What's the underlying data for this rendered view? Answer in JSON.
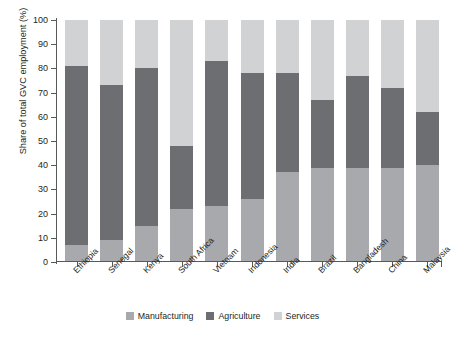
{
  "figure": {
    "cropped_title": "",
    "background": "#ffffff"
  },
  "chart_data": {
    "type": "bar",
    "subtype": "stacked-vertical-100",
    "title": "",
    "xlabel": "",
    "ylabel": "Share of total GVC employment (%)",
    "ylim": [
      0,
      100
    ],
    "yticks": [
      100,
      90,
      80,
      70,
      60,
      50,
      40,
      30,
      20,
      10,
      0
    ],
    "grid": false,
    "legend_position": "bottom-center",
    "categories": [
      "Ethiopia",
      "Senegal",
      "Kenya",
      "South Africa",
      "Vietnam",
      "Indonesia",
      "India",
      "Brazil",
      "Bangladesh",
      "China",
      "Malaysia"
    ],
    "series": [
      {
        "name": "Manufacturing",
        "color": "#a7a9ac",
        "values": [
          7,
          9,
          15,
          22,
          23,
          26,
          37,
          39,
          39,
          39,
          40
        ]
      },
      {
        "name": "Agriculture",
        "color": "#6d6e71",
        "values": [
          74,
          64,
          65,
          26,
          60,
          52,
          41,
          28,
          38,
          33,
          22
        ]
      },
      {
        "name": "Services",
        "color": "#d0d2d3",
        "values": [
          19,
          27,
          20,
          52,
          17,
          22,
          22,
          33,
          23,
          28,
          38
        ]
      }
    ],
    "cumulative_tops": {
      "manufacturing_top": [
        7,
        9,
        15,
        22,
        23,
        26,
        37,
        39,
        39,
        39,
        40
      ],
      "agriculture_top": [
        81,
        73,
        80,
        48,
        83,
        78,
        78,
        67,
        77,
        72,
        62
      ]
    }
  },
  "legend": {
    "items": [
      {
        "label": "Manufacturing",
        "color": "#a7a9ac"
      },
      {
        "label": "Agriculture",
        "color": "#6d6e71"
      },
      {
        "label": "Services",
        "color": "#d0d2d3"
      }
    ]
  }
}
